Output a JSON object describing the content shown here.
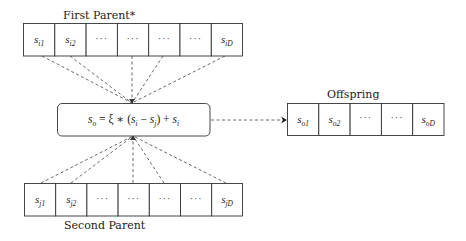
{
  "diagram": {
    "first_parent": {
      "label": "First Parent*",
      "cells": [
        {
          "base": "s",
          "sub": "i1"
        },
        {
          "base": "s",
          "sub": "i2"
        },
        {
          "base": "···",
          "sub": ""
        },
        {
          "base": "···",
          "sub": ""
        },
        {
          "base": "···",
          "sub": ""
        },
        {
          "base": "···",
          "sub": ""
        },
        {
          "base": "s",
          "sub": "iD"
        }
      ]
    },
    "second_parent": {
      "label": "Second Parent",
      "cells": [
        {
          "base": "s",
          "sub": "j1"
        },
        {
          "base": "s",
          "sub": "j2"
        },
        {
          "base": "···",
          "sub": ""
        },
        {
          "base": "···",
          "sub": ""
        },
        {
          "base": "···",
          "sub": ""
        },
        {
          "base": "···",
          "sub": ""
        },
        {
          "base": "s",
          "sub": "jD"
        }
      ]
    },
    "operator": {
      "formula": "s_o = ξ ∗ (s_i − s_j) + s_i",
      "parts": {
        "lhs_base": "s",
        "lhs_sub": "o",
        "eq": " = ξ ∗ (",
        "a_base": "s",
        "a_sub": "i",
        "minus": " − ",
        "b_base": "s",
        "b_sub": "j",
        "plus": ") + ",
        "c_base": "s",
        "c_sub": "i"
      }
    },
    "offspring": {
      "label": "Offspring",
      "cells": [
        {
          "base": "s",
          "sub": "o1"
        },
        {
          "base": "s",
          "sub": "o2"
        },
        {
          "base": "···",
          "sub": ""
        },
        {
          "base": "···",
          "sub": ""
        },
        {
          "base": "s",
          "sub": "oD"
        }
      ]
    },
    "connections": {
      "first_parent_to_operator": "dashed lines from cells 1, 2, 4, 5, 7",
      "second_parent_to_operator": "dashed lines from cells 1, 2, 4, 5, 7",
      "operator_to_offspring": "dashed arrow"
    }
  }
}
